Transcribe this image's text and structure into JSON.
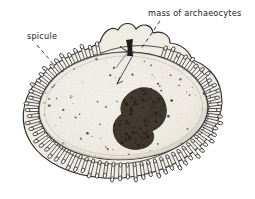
{
  "figure": {
    "name": "sponge-gemmule-cross-section",
    "background_color": "#ffffff",
    "ink_color": "#1c1c1c",
    "interior_color": "#f2efe7",
    "archaeocyte_mass_color": "#585048",
    "labels": {
      "spicule": "spicule",
      "archaeocytes": "mass of archaeocytes"
    },
    "parts": {
      "spicule_coat": "spicule-coat",
      "inner_membrane": "inner-membrane",
      "cavity": "gemmule-cavity",
      "archaeocyte_mass": "archaeocyte-mass",
      "micropyle": "micropyle",
      "leader_spicule": "leader-line-spicule",
      "leader_archaeocytes": "leader-line-archaeocytes",
      "pointer_internal": "internal-pointer"
    }
  }
}
